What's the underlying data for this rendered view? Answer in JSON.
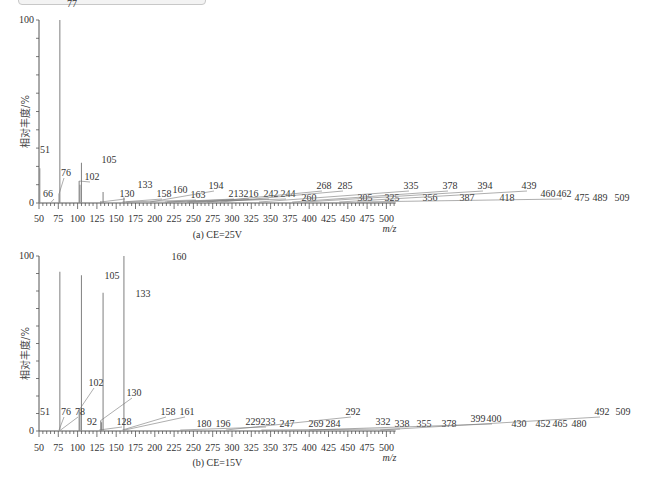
{
  "chart_data": [
    {
      "type": "bar",
      "title": "(a) CE=25V",
      "xlabel": "m/z",
      "ylabel": "相对丰度/%",
      "xlim": [
        50,
        512
      ],
      "ylim": [
        0,
        100
      ],
      "x_ticks": [
        50,
        75,
        100,
        125,
        150,
        175,
        200,
        225,
        250,
        275,
        300,
        325,
        350,
        375,
        400,
        425,
        450,
        475,
        500
      ],
      "y_ticks": [
        0,
        100
      ],
      "grid": false,
      "peaks": [
        {
          "mz": 51,
          "value": 19,
          "label": "51"
        },
        {
          "mz": 66,
          "value": 0.5,
          "label": "66"
        },
        {
          "mz": 76,
          "value": 5,
          "label": "76"
        },
        {
          "mz": 77,
          "value": 100,
          "label": "77"
        },
        {
          "mz": 102,
          "value": 12,
          "label": "102"
        },
        {
          "mz": 103,
          "value": 10,
          "label": ""
        },
        {
          "mz": 105,
          "value": 22,
          "label": "105"
        },
        {
          "mz": 130,
          "value": 1,
          "label": "130"
        },
        {
          "mz": 133,
          "value": 6,
          "label": "133"
        },
        {
          "mz": 158,
          "value": 0.5,
          "label": "158"
        },
        {
          "mz": 160,
          "value": 3,
          "label": "160"
        },
        {
          "mz": 163,
          "value": 0.5,
          "label": "163"
        },
        {
          "mz": 194,
          "value": 0.5,
          "label": "194"
        },
        {
          "mz": 213,
          "value": 0.3,
          "label": "213"
        },
        {
          "mz": 216,
          "value": 0.3,
          "label": "216"
        },
        {
          "mz": 242,
          "value": 0.3,
          "label": "242"
        },
        {
          "mz": 244,
          "value": 0.3,
          "label": "244"
        },
        {
          "mz": 260,
          "value": 0.3,
          "label": "260"
        },
        {
          "mz": 268,
          "value": 0.3,
          "label": "268"
        },
        {
          "mz": 285,
          "value": 0.3,
          "label": "285"
        },
        {
          "mz": 305,
          "value": 0.3,
          "label": "305"
        },
        {
          "mz": 325,
          "value": 0.3,
          "label": "325"
        },
        {
          "mz": 335,
          "value": 0.3,
          "label": "335"
        },
        {
          "mz": 356,
          "value": 0.3,
          "label": "356"
        },
        {
          "mz": 378,
          "value": 0.3,
          "label": "378"
        },
        {
          "mz": 387,
          "value": 0.3,
          "label": "387"
        },
        {
          "mz": 394,
          "value": 0.3,
          "label": "394"
        },
        {
          "mz": 418,
          "value": 0.3,
          "label": "418"
        },
        {
          "mz": 439,
          "value": 0.3,
          "label": "439"
        },
        {
          "mz": 460,
          "value": 0.3,
          "label": "460"
        },
        {
          "mz": 462,
          "value": 0.3,
          "label": "462"
        },
        {
          "mz": 475,
          "value": 0.3,
          "label": "475"
        },
        {
          "mz": 489,
          "value": 0.3,
          "label": "489"
        },
        {
          "mz": 509,
          "value": 0.3,
          "label": "509"
        }
      ]
    },
    {
      "type": "bar",
      "title": "(b) CE=15V",
      "xlabel": "m/z",
      "ylabel": "相对丰度/%",
      "xlim": [
        50,
        512
      ],
      "ylim": [
        0,
        100
      ],
      "x_ticks": [
        50,
        75,
        100,
        125,
        150,
        175,
        200,
        225,
        250,
        275,
        300,
        325,
        350,
        375,
        400,
        425,
        450,
        475,
        500
      ],
      "y_ticks": [
        0,
        100
      ],
      "grid": false,
      "peaks": [
        {
          "mz": 51,
          "value": 0.5,
          "label": "51"
        },
        {
          "mz": 76,
          "value": 0.5,
          "label": "76"
        },
        {
          "mz": 77,
          "value": 91,
          "label": "77"
        },
        {
          "mz": 78,
          "value": 0.5,
          "label": "78"
        },
        {
          "mz": 92,
          "value": 0.3,
          "label": "92"
        },
        {
          "mz": 102,
          "value": 12,
          "label": "102"
        },
        {
          "mz": 103,
          "value": 11,
          "label": ""
        },
        {
          "mz": 105,
          "value": 89,
          "label": "105"
        },
        {
          "mz": 128,
          "value": 0.3,
          "label": "128"
        },
        {
          "mz": 130,
          "value": 6,
          "label": "130"
        },
        {
          "mz": 131,
          "value": 5,
          "label": ""
        },
        {
          "mz": 133,
          "value": 79,
          "label": "133"
        },
        {
          "mz": 158,
          "value": 0.5,
          "label": "158"
        },
        {
          "mz": 160,
          "value": 100,
          "label": "160"
        },
        {
          "mz": 161,
          "value": 0.5,
          "label": "161"
        },
        {
          "mz": 180,
          "value": 0.3,
          "label": "180"
        },
        {
          "mz": 196,
          "value": 0.3,
          "label": "196"
        },
        {
          "mz": 229,
          "value": 0.3,
          "label": "229"
        },
        {
          "mz": 233,
          "value": 0.3,
          "label": "233"
        },
        {
          "mz": 247,
          "value": 0.3,
          "label": "247"
        },
        {
          "mz": 269,
          "value": 0.3,
          "label": "269"
        },
        {
          "mz": 284,
          "value": 0.3,
          "label": "284"
        },
        {
          "mz": 292,
          "value": 0.3,
          "label": "292"
        },
        {
          "mz": 332,
          "value": 0.3,
          "label": "332"
        },
        {
          "mz": 338,
          "value": 0.3,
          "label": "338"
        },
        {
          "mz": 355,
          "value": 0.3,
          "label": "355"
        },
        {
          "mz": 378,
          "value": 0.3,
          "label": "378"
        },
        {
          "mz": 399,
          "value": 0.3,
          "label": "399"
        },
        {
          "mz": 400,
          "value": 0.3,
          "label": "400"
        },
        {
          "mz": 430,
          "value": 0.3,
          "label": "430"
        },
        {
          "mz": 452,
          "value": 0.3,
          "label": "452"
        },
        {
          "mz": 465,
          "value": 0.3,
          "label": "465"
        },
        {
          "mz": 480,
          "value": 0.3,
          "label": "480"
        },
        {
          "mz": 492,
          "value": 0.3,
          "label": "492"
        },
        {
          "mz": 509,
          "value": 0.3,
          "label": "509"
        }
      ]
    }
  ],
  "panels": [
    {
      "caption": "(a) CE=25V",
      "ylabel": "相对丰度/%",
      "y_top_label": "100",
      "y_zero_label": "0",
      "xunit": "m/z",
      "label_pos": [
        [
          51,
          45,
          153,
          0
        ],
        [
          66,
          48,
          197,
          1
        ],
        [
          76,
          66,
          176,
          1
        ],
        [
          77,
          72,
          7,
          0
        ],
        [
          102,
          92,
          180,
          1
        ],
        [
          105,
          109,
          163,
          0
        ],
        [
          130,
          127,
          197,
          1
        ],
        [
          133,
          145,
          188,
          0
        ],
        [
          158,
          164,
          197,
          1
        ],
        [
          160,
          180,
          193,
          0
        ],
        [
          163,
          198,
          198,
          1
        ],
        [
          194,
          216,
          189,
          1
        ],
        [
          213,
          236,
          197,
          1
        ],
        [
          216,
          251,
          197,
          1
        ],
        [
          242,
          271,
          197,
          1
        ],
        [
          244,
          288,
          197,
          1
        ],
        [
          260,
          309,
          201,
          0
        ],
        [
          268,
          324,
          189,
          1
        ],
        [
          285,
          345,
          189,
          1
        ],
        [
          305,
          365,
          201,
          0
        ],
        [
          325,
          392,
          201,
          0
        ],
        [
          335,
          411,
          189,
          1
        ],
        [
          356,
          430,
          201,
          0
        ],
        [
          378,
          450,
          189,
          1
        ],
        [
          387,
          467,
          201,
          0
        ],
        [
          394,
          485,
          189,
          1
        ],
        [
          418,
          507,
          201,
          0
        ],
        [
          439,
          529,
          189,
          1
        ],
        [
          460,
          548,
          197,
          0
        ],
        [
          462,
          564,
          197,
          1
        ],
        [
          475,
          582,
          201,
          0
        ],
        [
          489,
          600,
          201,
          0
        ],
        [
          509,
          622,
          201,
          0
        ]
      ]
    },
    {
      "caption": "(b) CE=15V",
      "ylabel": "相对丰度/%",
      "y_top_label": "100",
      "y_zero_label": "0",
      "xunit": "m/z",
      "label_pos": [
        [
          51,
          45,
          415,
          0
        ],
        [
          76,
          66,
          415,
          1
        ],
        [
          78,
          80,
          415,
          1
        ],
        [
          92,
          92,
          425,
          0
        ],
        [
          102,
          96,
          386,
          1
        ],
        [
          105,
          112,
          279,
          0
        ],
        [
          128,
          124,
          425,
          1
        ],
        [
          130,
          134,
          396,
          1
        ],
        [
          133,
          143,
          297,
          0
        ],
        [
          158,
          168,
          415,
          1
        ],
        [
          160,
          179,
          260,
          0
        ],
        [
          161,
          187,
          415,
          1
        ],
        [
          180,
          204,
          427,
          0
        ],
        [
          196,
          223,
          427,
          0
        ],
        [
          229,
          253,
          425,
          0
        ],
        [
          233,
          268,
          425,
          1
        ],
        [
          247,
          287,
          427,
          0
        ],
        [
          269,
          316,
          427,
          0
        ],
        [
          284,
          333,
          427,
          0
        ],
        [
          292,
          353,
          415,
          1
        ],
        [
          332,
          383,
          425,
          0
        ],
        [
          338,
          402,
          427,
          1
        ],
        [
          355,
          424,
          427,
          0
        ],
        [
          378,
          449,
          427,
          0
        ],
        [
          399,
          478,
          422,
          0
        ],
        [
          400,
          494,
          422,
          1
        ],
        [
          430,
          519,
          427,
          0
        ],
        [
          452,
          543,
          427,
          0
        ],
        [
          465,
          560,
          427,
          0
        ],
        [
          480,
          579,
          427,
          0
        ],
        [
          492,
          602,
          415,
          1
        ],
        [
          509,
          623,
          415,
          0
        ]
      ]
    }
  ],
  "colors": {
    "axis": "#555555",
    "peak": "#8a8a8a",
    "text": "#333333"
  }
}
